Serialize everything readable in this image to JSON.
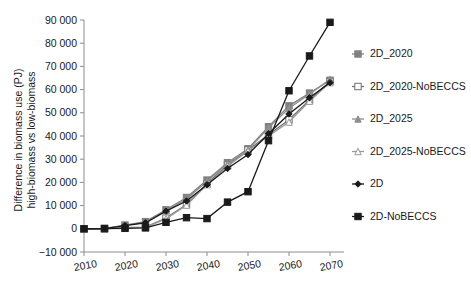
{
  "chart_data": {
    "type": "line",
    "title": "",
    "xlabel": "",
    "ylabel": "Difference in biomass use (PJ) high-biomass vs low-biomass",
    "ylabel_line1": "Difference in biomass use (PJ)",
    "ylabel_line2": "high-biomass vs low-biomass",
    "x": [
      2010,
      2015,
      2020,
      2025,
      2030,
      2035,
      2040,
      2045,
      2050,
      2055,
      2060,
      2065,
      2070
    ],
    "xlim": [
      2010,
      2070
    ],
    "ylim": [
      -10000,
      90000
    ],
    "xticks": [
      2010,
      2020,
      2030,
      2040,
      2050,
      2060,
      2070
    ],
    "xticklabels": [
      "2010",
      "2020",
      "2030",
      "2040",
      "2050",
      "2060",
      "2070"
    ],
    "yticks": [
      -10000,
      0,
      10000,
      20000,
      30000,
      40000,
      50000,
      60000,
      70000,
      80000,
      90000
    ],
    "yticklabels": [
      "−10 000",
      "0",
      "10 000",
      "20 000",
      "30 000",
      "40 000",
      "50 000",
      "60 000",
      "70 000",
      "80 000",
      "90 000"
    ],
    "grid": false,
    "legend_position": "right",
    "series": [
      {
        "name": "2D_2020",
        "color": "#808080",
        "marker": "square",
        "x": [
          2010,
          2015,
          2020,
          2025,
          2030,
          2035,
          2040,
          2045,
          2050,
          2055,
          2060,
          2065,
          2070
        ],
        "values": [
          0,
          200,
          1600,
          3100,
          8200,
          13500,
          21000,
          28500,
          34500,
          44000,
          53000,
          58500,
          64000
        ]
      },
      {
        "name": "2D_2020-NoBECCS",
        "color": "#707070",
        "marker": "square-open",
        "x": [
          2010,
          2015,
          2020,
          2025,
          2030,
          2035,
          2040,
          2045,
          2050,
          2055,
          2060,
          2065,
          2070
        ],
        "values": [
          0,
          0,
          600,
          700,
          4600,
          10500,
          19500,
          27500,
          34000,
          40500,
          47000,
          55500,
          63500
        ]
      },
      {
        "name": "2D_2025",
        "color": "#8f8f8f",
        "marker": "triangle",
        "x": [
          2010,
          2015,
          2020,
          2025,
          2030,
          2035,
          2040,
          2045,
          2050,
          2055,
          2060,
          2065,
          2070
        ],
        "values": [
          0,
          0,
          1500,
          2900,
          7900,
          12800,
          20500,
          28000,
          34000,
          43500,
          52000,
          58000,
          64500
        ]
      },
      {
        "name": "2D_2025-NoBECCS",
        "color": "#9a9a9a",
        "marker": "triangle-open",
        "x": [
          2010,
          2015,
          2020,
          2025,
          2030,
          2035,
          2040,
          2045,
          2050,
          2055,
          2060,
          2065,
          2070
        ],
        "values": [
          0,
          0,
          500,
          600,
          4300,
          10200,
          19000,
          27000,
          33500,
          40000,
          46000,
          55000,
          63000
        ]
      },
      {
        "name": "2D",
        "color": "#1a1a1a",
        "marker": "diamond",
        "x": [
          2010,
          2015,
          2020,
          2025,
          2030,
          2035,
          2040,
          2045,
          2050,
          2055,
          2060,
          2065,
          2070
        ],
        "values": [
          0,
          100,
          1400,
          2600,
          7600,
          12000,
          19000,
          26000,
          32000,
          41000,
          49500,
          56500,
          63000
        ]
      },
      {
        "name": "2D-NoBECCS",
        "color": "#1a1a1a",
        "marker": "square-filled",
        "x": [
          2010,
          2015,
          2020,
          2025,
          2030,
          2035,
          2040,
          2045,
          2050,
          2055,
          2060,
          2065,
          2070
        ],
        "values": [
          0,
          100,
          200,
          400,
          2800,
          4800,
          4400,
          11500,
          16000,
          38000,
          59500,
          74500,
          89000
        ]
      }
    ]
  }
}
